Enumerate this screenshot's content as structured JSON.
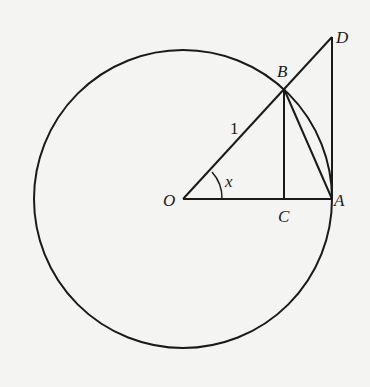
{
  "diagram": {
    "points": {
      "O": {
        "label": "O",
        "x": 183,
        "y": 199
      },
      "A": {
        "label": "A",
        "x": 332,
        "y": 199
      },
      "B": {
        "label": "B",
        "x": 284,
        "y": 89
      },
      "C": {
        "label": "C",
        "x": 284,
        "y": 199
      },
      "D": {
        "label": "D",
        "x": 332,
        "y": 37
      }
    },
    "circle": {
      "center": "O",
      "radius": 149
    },
    "segments": [
      [
        "O",
        "D"
      ],
      [
        "O",
        "A"
      ],
      [
        "B",
        "C"
      ],
      [
        "B",
        "A"
      ],
      [
        "A",
        "D"
      ]
    ],
    "labels": {
      "radius": "1",
      "angle": "x"
    },
    "colors": {
      "stroke": "#1a1a1a",
      "background": "#f4f4f2"
    }
  }
}
